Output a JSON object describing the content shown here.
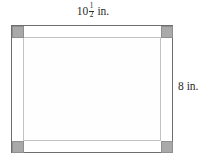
{
  "figure": {
    "kind": "rectangular-picture-frame-diagram",
    "top_dimension": {
      "whole": "10",
      "numerator": "1",
      "denominator": "2",
      "unit": "in.",
      "full_text": "10 1/2 in."
    },
    "right_dimension": {
      "value": "8 in."
    },
    "colors": {
      "outline": "#6d6d6d",
      "inner_outline": "#c2c2c2",
      "corner_fill": "#a9a9a9",
      "corner_stroke": "#8f8f8f",
      "background": "#ffffff"
    },
    "corners": [
      {
        "position": "top-left"
      },
      {
        "position": "top-right"
      },
      {
        "position": "bottom-left"
      },
      {
        "position": "bottom-right"
      }
    ]
  }
}
